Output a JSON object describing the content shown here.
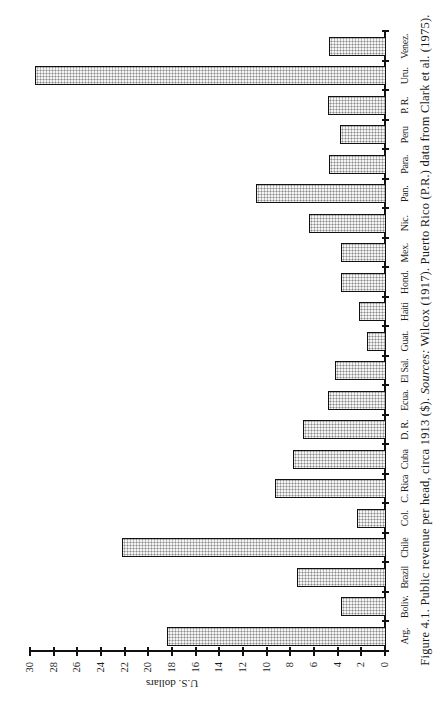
{
  "chart_data": {
    "type": "bar",
    "orientation": "vertical (page rotated 90° counter-clockwise in screenshot)",
    "title": "Figure 4.1. Public revenue per head, circa 1913 ($).",
    "xlabel": "",
    "ylabel": "U.S. dollars",
    "ylim": [
      0,
      30
    ],
    "yticks": [
      0,
      2,
      4,
      6,
      8,
      10,
      12,
      14,
      16,
      18,
      20,
      22,
      24,
      26,
      28,
      30
    ],
    "grid": false,
    "legend": null,
    "categories": [
      "Arg.",
      "Boliv.",
      "Brazil",
      "Chile",
      "Col.",
      "C. Rica",
      "Cuba",
      "D. R.",
      "Ecua.",
      "El Sal.",
      "Guat.",
      "Haiti",
      "Hond.",
      "Mex.",
      "Nic.",
      "Pan.",
      "Para.",
      "Peru",
      "P. R.",
      "Uru.",
      "Venez."
    ],
    "values": [
      18.4,
      3.7,
      7.4,
      22.2,
      2.4,
      9.3,
      7.8,
      6.9,
      4.8,
      4.2,
      1.5,
      2.2,
      3.7,
      3.7,
      6.4,
      10.9,
      4.7,
      3.8,
      4.8,
      29.6,
      4.7
    ],
    "bar_style": "stippled gray fill with black outline"
  },
  "caption": {
    "figure_label": "Figure 4.1.",
    "title": "Public revenue per head, circa 1913 ($).",
    "sources_label": "Sources:",
    "sources_text": "Wilcox (1917). Puerto Rico (P.R.) data from Clark et al. (1975)."
  },
  "axis": {
    "ylabel": "U.S. dollars"
  }
}
